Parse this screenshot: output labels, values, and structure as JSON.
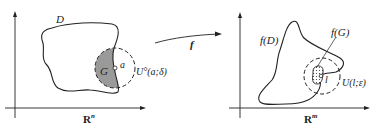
{
  "diagram": {
    "left_panel": {
      "space_label": "R",
      "space_superscript": "n",
      "domain_label": "D",
      "subset_label": "G",
      "point_label": "a",
      "neighborhood_label": "U°(a;δ)"
    },
    "mapping": {
      "label": "f"
    },
    "right_panel": {
      "space_label": "R",
      "space_superscript": "m",
      "image_domain_label": "f(D)",
      "image_subset_label": "f(G)",
      "point_label": "l",
      "neighborhood_label": "U(l;ε)"
    },
    "colors": {
      "stroke": "#222222",
      "shaded_region": "#9a9a9a",
      "background": "#ffffff"
    }
  }
}
